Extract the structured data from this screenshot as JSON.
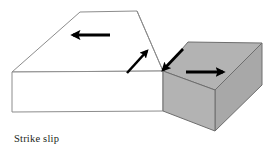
{
  "figure": {
    "caption": "Strike slip",
    "type": "geologic-block-diagram",
    "colors": {
      "background": "#ffffff",
      "footwall_block_fill": "#ffffff",
      "hanging_block_top_fill": "#b3b3b3",
      "hanging_block_front_fill": "#b3b3b3",
      "hanging_block_side_fill": "#a8a8a8",
      "outline": "#8c8c8c",
      "arrow": "#000000",
      "caption_text": "#231f20"
    }
  },
  "blocks": [
    {
      "name": "left-block",
      "label": "left crustal block",
      "fill": "#ffffff",
      "top_face_points": "12,72 80,12 137,11 163,71",
      "front_face_points": "12,72 163,71 163,111 12,112"
    },
    {
      "name": "right-block",
      "label": "right crustal block (offset)",
      "top_face_points": "163,71 188,42 262,43 215,90",
      "front_face_points": "163,71 215,90 215,131 163,111",
      "side_face_points": "215,90 262,43 262,85 215,131"
    }
  ],
  "arrows": [
    {
      "name": "left-block-motion-arrow",
      "direction": "left",
      "meaning": "left block moves left (away from viewer side)",
      "x1": 110,
      "y1": 35,
      "x2": 73,
      "y2": 35
    },
    {
      "name": "fault-plane-up-arrow",
      "direction": "up-right",
      "meaning": "relative slip direction on fault plane (left wall)",
      "x1": 127,
      "y1": 73,
      "x2": 147,
      "y2": 51
    },
    {
      "name": "fault-plane-down-arrow",
      "direction": "down-left",
      "meaning": "relative slip direction on fault plane (right wall)",
      "x1": 183,
      "y1": 49,
      "x2": 163,
      "y2": 70
    },
    {
      "name": "right-block-motion-arrow",
      "direction": "right",
      "meaning": "right block moves right (toward viewer side)",
      "x1": 186,
      "y1": 72,
      "x2": 223,
      "y2": 72
    }
  ]
}
